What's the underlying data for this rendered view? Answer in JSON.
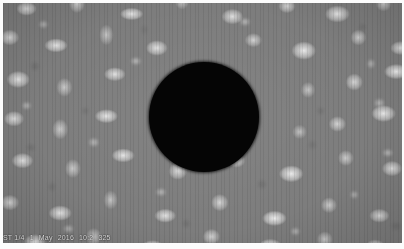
{
  "viewer": {
    "width": 404,
    "height": 249,
    "title": "Solar Granulation Frame"
  },
  "image": {
    "name": "solar-granulation-field",
    "description": "Greyscale solar photosphere granulation with central dark occulting disk",
    "background_color": "#7d7d7d",
    "area": {
      "x": 3,
      "y": 3,
      "width": 399,
      "height": 240
    }
  },
  "occulting_disk": {
    "name": "occulting-disk",
    "center_x": 204,
    "center_y": 117,
    "radius": 55,
    "color": "#050505"
  },
  "overlay": {
    "name": "timestamp-overlay",
    "full_text": "ST 1/4  1 May 2016 10:2 325",
    "tokens": [
      {
        "label": "ST 1/4"
      },
      {
        "label": "1"
      },
      {
        "label": "May"
      },
      {
        "label": "2016"
      },
      {
        "label": "10:2"
      },
      {
        "label": "325"
      }
    ],
    "color": "#f2f2f2"
  },
  "frame": {
    "name": "image-frame",
    "border_color": "#fcfcfc",
    "top": 3,
    "left": 3,
    "right": 2,
    "bottom": 6
  }
}
